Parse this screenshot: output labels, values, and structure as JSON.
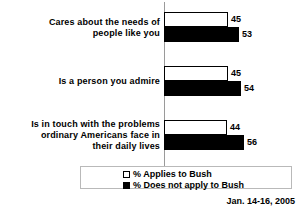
{
  "chart_data": {
    "type": "bar",
    "orientation": "horizontal",
    "title": "",
    "xlabel": "",
    "ylabel": "",
    "xlim": [
      0,
      65
    ],
    "grid": false,
    "legend_position": "bottom",
    "categories": [
      "Cares about the needs of people like you",
      "Is a person you admire",
      "Is in touch with the problems ordinary Americans face in their daily lives"
    ],
    "series": [
      {
        "name": "% Applies to Bush",
        "values": [
          45,
          45,
          44
        ],
        "color": "#ffffff"
      },
      {
        "name": "% Does not apply to Bush",
        "values": [
          53,
          54,
          56
        ],
        "color": "#000000"
      }
    ],
    "annotations": [
      "Jan. 14-16, 2005"
    ]
  },
  "groups": [
    {
      "label_lines": [
        "Cares about the needs of",
        "people like you"
      ],
      "applies": {
        "value": "45",
        "pct": 45
      },
      "not_applies": {
        "value": "53",
        "pct": 53
      }
    },
    {
      "label_lines": [
        "Is a person you admire"
      ],
      "applies": {
        "value": "45",
        "pct": 45
      },
      "not_applies": {
        "value": "54",
        "pct": 54
      }
    },
    {
      "label_lines": [
        "Is in touch with the problems",
        "ordinary Americans face in",
        "their daily lives"
      ],
      "applies": {
        "value": "44",
        "pct": 44
      },
      "not_applies": {
        "value": "56",
        "pct": 56
      }
    }
  ],
  "legend": {
    "applies_label": "% Applies to Bush",
    "not_applies_label": "% Does not apply to Bush"
  },
  "footer": {
    "date": "Jan. 14-16, 2005"
  }
}
